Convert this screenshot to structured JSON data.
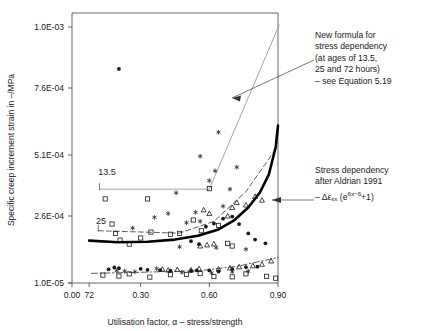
{
  "chart_data": {
    "type": "scatter",
    "title": "",
    "xlabel": "Utilisation factor, α – stress/strength",
    "ylabel": "Specific creep increment strain in –/MPa",
    "xlim": [
      0.0,
      0.9
    ],
    "ylim": [
      1e-05,
      0.001
    ],
    "grid": false,
    "legend_position": "none",
    "xticks": [
      {
        "value": 0.0,
        "label": "0.00"
      },
      {
        "value": 0.3,
        "label": "0.30"
      },
      {
        "value": 0.6,
        "label": "0.60"
      },
      {
        "value": 0.9,
        "label": "0.90"
      }
    ],
    "extra_xticks": [
      {
        "value": 0.075,
        "label": "72"
      }
    ],
    "yticks": [
      {
        "value": 0.001,
        "label": "1.0E-03"
      },
      {
        "value": 0.00076,
        "label": "7.6E-04"
      },
      {
        "value": 0.00051,
        "label": "5.1E-04"
      },
      {
        "value": 0.00026,
        "label": "2.6E-04"
      },
      {
        "value": 1e-05,
        "label": "1.0E-05"
      }
    ],
    "inline_labels": [
      {
        "text": "13.5",
        "x": 0.115,
        "y": 0.00043
      },
      {
        "text": "25",
        "x": 0.105,
        "y": 0.00023
      }
    ],
    "series": [
      {
        "name": "new-formula-13.5h",
        "style": "thin-solid-grey",
        "points": [
          {
            "x": 0.12,
            "y": 0.00037
          },
          {
            "x": 0.6,
            "y": 0.00037
          },
          {
            "x": 0.905,
            "y": 0.00102
          }
        ]
      },
      {
        "name": "new-formula-25h",
        "style": "dashed",
        "points": [
          {
            "x": 0.115,
            "y": 0.000205
          },
          {
            "x": 0.47,
            "y": 0.000196
          },
          {
            "x": 0.62,
            "y": 0.00024
          },
          {
            "x": 0.76,
            "y": 0.00036
          },
          {
            "x": 0.88,
            "y": 0.00052
          }
        ]
      },
      {
        "name": "new-formula-72h",
        "style": "dash-dot",
        "points": [
          {
            "x": 0.085,
            "y": 4.6e-05
          },
          {
            "x": 0.3,
            "y": 5e-05
          },
          {
            "x": 0.56,
            "y": 5.6e-05
          },
          {
            "x": 0.72,
            "y": 7.2e-05
          },
          {
            "x": 0.9,
            "y": 0.000105
          }
        ]
      },
      {
        "name": "aldrian-1991-stress-dependency",
        "style": "thick-solid-black",
        "points": [
          {
            "x": 0.075,
            "y": 0.000168
          },
          {
            "x": 0.2,
            "y": 0.000162
          },
          {
            "x": 0.33,
            "y": 0.000164
          },
          {
            "x": 0.45,
            "y": 0.000172
          },
          {
            "x": 0.55,
            "y": 0.000186
          },
          {
            "x": 0.64,
            "y": 0.00021
          },
          {
            "x": 0.71,
            "y": 0.000245
          },
          {
            "x": 0.77,
            "y": 0.000295
          },
          {
            "x": 0.82,
            "y": 0.000355
          },
          {
            "x": 0.86,
            "y": 0.00043
          },
          {
            "x": 0.89,
            "y": 0.00054
          },
          {
            "x": 0.9,
            "y": 0.00062
          }
        ]
      },
      {
        "name": "measurements-filled-circle",
        "style": "marker-filled-circle",
        "points": [
          {
            "x": 0.205,
            "y": 0.000835
          },
          {
            "x": 0.16,
            "y": 6.1e-05
          },
          {
            "x": 0.185,
            "y": 6.8e-05
          },
          {
            "x": 0.205,
            "y": 6.5e-05
          },
          {
            "x": 0.3,
            "y": 6.3e-05
          },
          {
            "x": 0.33,
            "y": 5.9e-05
          },
          {
            "x": 0.385,
            "y": 5.8e-05
          },
          {
            "x": 0.43,
            "y": 5.6e-05
          },
          {
            "x": 0.52,
            "y": 5.5e-05
          },
          {
            "x": 0.545,
            "y": 5.7e-05
          },
          {
            "x": 0.6,
            "y": 5.7e-05
          },
          {
            "x": 0.64,
            "y": 5.3e-05
          },
          {
            "x": 0.7,
            "y": 6.2e-05
          },
          {
            "x": 0.76,
            "y": 6.9e-05
          },
          {
            "x": 0.81,
            "y": 7.1e-05
          },
          {
            "x": 0.585,
            "y": 0.00022
          },
          {
            "x": 0.62,
            "y": 0.000232
          },
          {
            "x": 0.66,
            "y": 0.00025
          },
          {
            "x": 0.7,
            "y": 0.000258
          },
          {
            "x": 0.73,
            "y": 0.00023
          },
          {
            "x": 0.77,
            "y": 0.000195
          },
          {
            "x": 0.8,
            "y": 0.000172
          },
          {
            "x": 0.52,
            "y": 0.000166
          },
          {
            "x": 0.555,
            "y": 0.000155
          },
          {
            "x": 0.845,
            "y": 0.000158
          }
        ]
      },
      {
        "name": "measurements-open-square",
        "style": "marker-open-square",
        "points": [
          {
            "x": 0.145,
            "y": 0.00033
          },
          {
            "x": 0.175,
            "y": 0.00023
          },
          {
            "x": 0.19,
            "y": 0.000195
          },
          {
            "x": 0.21,
            "y": 0.00017
          },
          {
            "x": 0.25,
            "y": 0.000155
          },
          {
            "x": 0.3,
            "y": 0.000178
          },
          {
            "x": 0.33,
            "y": 0.00033
          },
          {
            "x": 0.345,
            "y": 0.0002
          },
          {
            "x": 0.43,
            "y": 0.000192
          },
          {
            "x": 0.47,
            "y": 0.000195
          },
          {
            "x": 0.53,
            "y": 0.000245
          },
          {
            "x": 0.565,
            "y": 0.000205
          },
          {
            "x": 0.6,
            "y": 0.000372
          },
          {
            "x": 0.64,
            "y": 0.000225
          },
          {
            "x": 0.68,
            "y": 0.000158
          },
          {
            "x": 0.7,
            "y": 0.000148
          },
          {
            "x": 0.135,
            "y": 3.95e-05
          },
          {
            "x": 0.205,
            "y": 3.6e-05
          },
          {
            "x": 0.25,
            "y": 4.4e-05
          },
          {
            "x": 0.34,
            "y": 3.2e-05
          },
          {
            "x": 0.43,
            "y": 4.1e-05
          },
          {
            "x": 0.5,
            "y": 4.2e-05
          },
          {
            "x": 0.56,
            "y": 4.5e-05
          },
          {
            "x": 0.62,
            "y": 3.4e-05
          },
          {
            "x": 0.7,
            "y": 3.3e-05
          },
          {
            "x": 0.76,
            "y": 4.4e-05
          },
          {
            "x": 0.85,
            "y": 3.5e-05
          },
          {
            "x": 0.89,
            "y": 2.8e-05
          }
        ]
      },
      {
        "name": "measurements-open-triangle",
        "style": "marker-open-triangle",
        "points": [
          {
            "x": 0.395,
            "y": 6.1e-05
          },
          {
            "x": 0.42,
            "y": 5.8e-05
          },
          {
            "x": 0.46,
            "y": 6e-05
          },
          {
            "x": 0.52,
            "y": 5.8e-05
          },
          {
            "x": 0.555,
            "y": 6.3e-05
          },
          {
            "x": 0.64,
            "y": 6.2e-05
          },
          {
            "x": 0.69,
            "y": 6.6e-05
          },
          {
            "x": 0.73,
            "y": 7e-05
          },
          {
            "x": 0.79,
            "y": 7.4e-05
          },
          {
            "x": 0.83,
            "y": 8e-05
          },
          {
            "x": 0.87,
            "y": 9.2e-05
          },
          {
            "x": 0.56,
            "y": 0.000148
          },
          {
            "x": 0.59,
            "y": 0.000152
          },
          {
            "x": 0.62,
            "y": 0.000156
          },
          {
            "x": 0.68,
            "y": 0.00026
          },
          {
            "x": 0.7,
            "y": 0.000295
          },
          {
            "x": 0.72,
            "y": 0.000315
          },
          {
            "x": 0.76,
            "y": 0.000305
          },
          {
            "x": 0.8,
            "y": 0.00034
          },
          {
            "x": 0.83,
            "y": 0.000325
          },
          {
            "x": 0.575,
            "y": 0.000285
          },
          {
            "x": 0.6,
            "y": 0.00027
          }
        ]
      },
      {
        "name": "measurements-asterisk",
        "style": "marker-asterisk",
        "points": [
          {
            "x": 0.265,
            "y": 0.000215
          },
          {
            "x": 0.36,
            "y": 0.000255
          },
          {
            "x": 0.42,
            "y": 0.00027
          },
          {
            "x": 0.455,
            "y": 0.000355
          },
          {
            "x": 0.5,
            "y": 0.000235
          },
          {
            "x": 0.54,
            "y": 0.000275
          },
          {
            "x": 0.56,
            "y": 0.00024
          },
          {
            "x": 0.6,
            "y": 0.000405
          },
          {
            "x": 0.625,
            "y": 0.000445
          },
          {
            "x": 0.66,
            "y": 0.0003
          },
          {
            "x": 0.69,
            "y": 0.00037
          },
          {
            "x": 0.72,
            "y": 0.00046
          },
          {
            "x": 0.64,
            "y": 0.000595
          },
          {
            "x": 0.56,
            "y": 0.000505
          },
          {
            "x": 0.195,
            "y": 5.6e-05
          },
          {
            "x": 0.23,
            "y": 5.4e-05
          },
          {
            "x": 0.275,
            "y": 5.2e-05
          },
          {
            "x": 0.37,
            "y": 6.4e-05
          },
          {
            "x": 0.48,
            "y": 5e-05
          },
          {
            "x": 0.61,
            "y": 4.8e-05
          },
          {
            "x": 0.7,
            "y": 5.2e-05
          },
          {
            "x": 0.77,
            "y": 5.4e-05
          },
          {
            "x": 0.47,
            "y": 0.000145
          },
          {
            "x": 0.63,
            "y": 0.000142
          },
          {
            "x": 0.76,
            "y": 0.000136
          }
        ]
      }
    ],
    "annotations": [
      {
        "name": "new-formula-note",
        "lines": [
          "New formula for",
          "stress dependency",
          "(at ages of 13.5,",
          "25 and 72 hours)",
          "– see Equation 5.19"
        ]
      },
      {
        "name": "aldrian-note",
        "lines": [
          "Stress dependency",
          "after Aldrian 1991"
        ],
        "formula_prefix": "– Δε",
        "formula_sub": "xx",
        "formula_mid": " (e",
        "formula_sup": "6x−6",
        "formula_suffix": "+1)"
      }
    ]
  },
  "colors": {
    "axis": "#555555",
    "thin_line": "#9a9a9a",
    "thick_line": "#000000",
    "dashed_line": "#333333",
    "marker": "#1a1a1a",
    "text": "#1a1a1a"
  }
}
